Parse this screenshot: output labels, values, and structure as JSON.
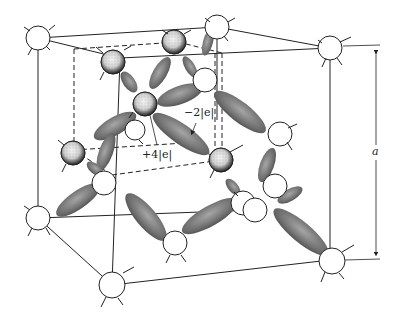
{
  "diagram": {
    "labels": {
      "bond_charge": "−2|e|",
      "core_charge": "+4|e|",
      "lattice_constant": "a"
    },
    "legend_semantics": {
      "stippled_spheres": "interior atoms (ion cores +4|e|)",
      "open_circles": "atoms on cube corners / faces",
      "gray_ellipsoids": "covalent bond electron charge clouds (−2|e|)",
      "dashed_lines": "inner sub-cube",
      "dimension_arrow": "cube edge length a"
    },
    "colors": {
      "line": "#222222",
      "bond": "#6e6e6e",
      "bond_highlight": "#a0a0a0",
      "stipple_dark": "#333333",
      "background": "#ffffff"
    }
  }
}
